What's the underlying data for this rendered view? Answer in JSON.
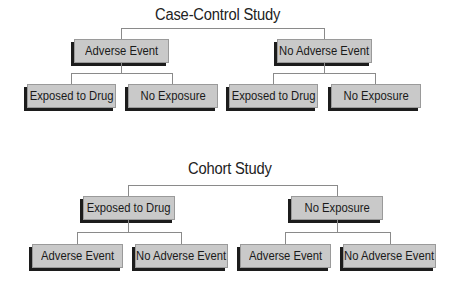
{
  "diagrams": [
    {
      "title": "Case-Control Study",
      "root_branches": [
        {
          "label": "Adverse Event",
          "children": [
            "Exposed to Drug",
            "No Exposure"
          ]
        },
        {
          "label": "No Adverse Event",
          "children": [
            "Exposed to Drug",
            "No Exposure"
          ]
        }
      ]
    },
    {
      "title": "Cohort Study",
      "root_branches": [
        {
          "label": "Exposed to Drug",
          "children": [
            "Adverse Event",
            "No Adverse Event"
          ]
        },
        {
          "label": "No Exposure",
          "children": [
            "Adverse Event",
            "No Adverse Event"
          ]
        }
      ]
    }
  ],
  "colors": {
    "box_fill": "#c9c9c9",
    "box_shadow": "#1c1c1c",
    "connector": "#8a8a8a",
    "text": "#1a1a1a"
  }
}
